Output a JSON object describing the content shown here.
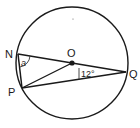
{
  "diagram": {
    "type": "circle-geometry",
    "points": {
      "N": {
        "label": "N",
        "x": 18,
        "y": 54
      },
      "P": {
        "label": "P",
        "x": 22,
        "y": 88
      },
      "O": {
        "label": "O",
        "x": 72,
        "y": 63
      },
      "Q": {
        "label": "Q",
        "x": 126,
        "y": 72
      }
    },
    "angles": {
      "a": {
        "label": "a",
        "vertex": "N"
      },
      "oqp": {
        "label": "12°",
        "vertex": "Q"
      }
    },
    "segments": [
      "NQ",
      "NP",
      "PO",
      "PQ"
    ],
    "circle": {
      "center": "O",
      "cx": 72,
      "cy": 63,
      "r": 56
    },
    "colors": {
      "stroke": "#1a1a1a",
      "background": "#ffffff"
    }
  }
}
